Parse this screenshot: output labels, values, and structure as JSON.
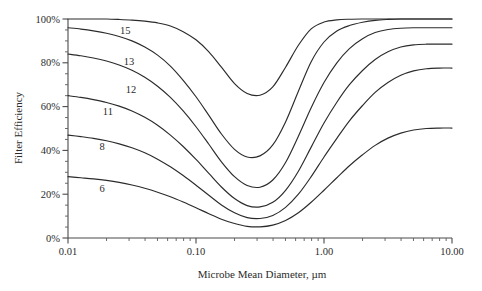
{
  "chart_data": {
    "type": "line",
    "title": "",
    "xlabel": "Microbe Mean Diameter, µm",
    "ylabel": "Filter Efficiency",
    "xscale": "log",
    "xlim": [
      0.01,
      10.0
    ],
    "ylim": [
      0,
      100
    ],
    "grid": false,
    "legend": "inline-curve-labels",
    "x_tick_labels": [
      "0.01",
      "0.10",
      "1.00",
      "10.00"
    ],
    "x_tick_values": [
      0.01,
      0.1,
      1.0,
      10.0
    ],
    "y_tick_labels": [
      "0%",
      "20%",
      "40%",
      "60%",
      "80%",
      "100%"
    ],
    "y_tick_values": [
      0,
      20,
      40,
      60,
      80,
      100
    ],
    "y_minor_step": 5,
    "x": [
      0.01,
      0.0126,
      0.0158,
      0.02,
      0.0251,
      0.0316,
      0.0398,
      0.0501,
      0.0631,
      0.0794,
      0.1,
      0.126,
      0.158,
      0.2,
      0.251,
      0.316,
      0.398,
      0.501,
      0.631,
      0.794,
      1.0,
      1.26,
      1.58,
      2.0,
      2.51,
      3.16,
      3.98,
      5.01,
      6.31,
      7.94,
      10.0
    ],
    "series": [
      {
        "name": "15",
        "label": "15",
        "label_x": 0.028,
        "label_y": 93,
        "values": [
          100,
          100,
          100,
          100,
          99.8,
          99.5,
          99.0,
          98.2,
          96.8,
          94.2,
          90.5,
          85.0,
          78.0,
          70.5,
          66.0,
          65.2,
          69.0,
          78.0,
          88.0,
          95.5,
          98.6,
          99.6,
          99.9,
          100,
          100,
          100,
          100,
          100,
          100,
          100,
          100
        ]
      },
      {
        "name": "13",
        "label": "13",
        "label_x": 0.03,
        "label_y": 79,
        "values": [
          96,
          95.4,
          94.6,
          93.5,
          92.0,
          90.0,
          87.2,
          83.5,
          78.5,
          72.0,
          64.5,
          56.0,
          47.5,
          40.5,
          37.0,
          37.5,
          42.5,
          53.0,
          67.0,
          80.5,
          89.5,
          94.5,
          97.0,
          98.5,
          99.4,
          99.8,
          100,
          100,
          100,
          100,
          100
        ]
      },
      {
        "name": "12",
        "label": "12",
        "label_x": 0.031,
        "label_y": 66,
        "values": [
          84,
          83.2,
          82.2,
          80.8,
          79.0,
          76.6,
          73.4,
          69.3,
          64.2,
          58.0,
          50.8,
          42.8,
          34.8,
          28.0,
          24.0,
          23.2,
          26.5,
          34.5,
          46.5,
          59.5,
          71.0,
          80.0,
          86.5,
          91.0,
          93.8,
          95.2,
          95.8,
          96.0,
          96.0,
          96.0,
          96.0
        ]
      },
      {
        "name": "11",
        "label": "11",
        "label_x": 0.0205,
        "label_y": 56,
        "values": [
          65,
          64.2,
          63.2,
          61.9,
          60.2,
          58.0,
          55.1,
          51.5,
          47.0,
          41.8,
          35.9,
          29.5,
          23.3,
          18.0,
          14.8,
          14.2,
          16.3,
          21.8,
          30.5,
          41.5,
          52.5,
          62.0,
          70.0,
          76.5,
          81.5,
          85.0,
          87.2,
          88.2,
          88.5,
          88.5,
          88.5
        ]
      },
      {
        "name": "8",
        "label": "8",
        "label_x": 0.0185,
        "label_y": 40,
        "values": [
          47,
          46.3,
          45.5,
          44.4,
          43.0,
          41.2,
          38.9,
          36.0,
          32.5,
          28.5,
          24.1,
          19.5,
          15.1,
          11.5,
          9.3,
          8.9,
          10.3,
          14.0,
          20.0,
          28.0,
          37.0,
          45.5,
          53.5,
          60.5,
          66.5,
          71.0,
          74.3,
          76.3,
          77.3,
          77.6,
          77.6
        ]
      },
      {
        "name": "6",
        "label": "6",
        "label_x": 0.0185,
        "label_y": 21,
        "values": [
          28,
          27.5,
          27.0,
          26.3,
          25.4,
          24.2,
          22.7,
          20.9,
          18.8,
          16.4,
          13.8,
          11.1,
          8.6,
          6.6,
          5.3,
          5.1,
          5.9,
          8.0,
          11.5,
          16.3,
          21.8,
          27.5,
          33.0,
          38.0,
          42.3,
          45.6,
          47.9,
          49.3,
          50.0,
          50.2,
          50.2
        ]
      }
    ]
  },
  "colors": {
    "curve": "#2b2b2b",
    "axis": "#4a4a4a",
    "text": "#2b2b2b",
    "background": "#ffffff"
  }
}
